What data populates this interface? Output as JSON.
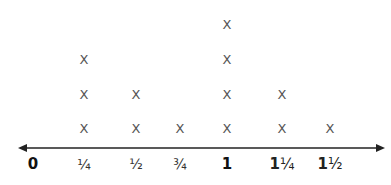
{
  "chart_data": {
    "type": "line_plot",
    "title": "",
    "xlabel": "",
    "ylabel": "",
    "marker": "X",
    "categories": [
      "0",
      "1/4",
      "1/2",
      "3/4",
      "1",
      "1 1/4",
      "1 1/2"
    ],
    "tick_labels": [
      "0",
      "¼",
      "½",
      "¾",
      "1",
      "1¼",
      "1½"
    ],
    "x_values": [
      0,
      0.25,
      0.5,
      0.75,
      1,
      1.25,
      1.5
    ],
    "values": [
      0,
      3,
      2,
      1,
      4,
      2,
      1
    ],
    "axis": {
      "arrows": "both",
      "xlim": [
        0,
        1.5
      ],
      "grid": false
    },
    "legend": null
  },
  "layout": {
    "axis_y": 148,
    "axis_x_start": 18,
    "axis_x_end": 385,
    "label_y": 164,
    "tick_x": [
      33,
      84,
      136,
      180,
      227,
      282,
      330
    ],
    "row_y": [
      128,
      94,
      59,
      24
    ],
    "colors": {
      "axis": "#222222",
      "mark": "#555555",
      "label": "#222222"
    }
  }
}
